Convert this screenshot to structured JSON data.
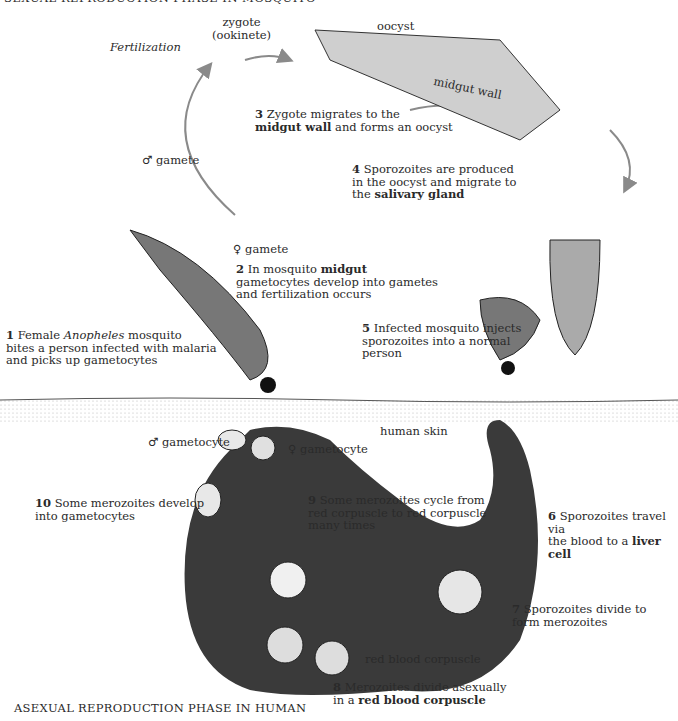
{
  "header": {
    "title_top": "SEXUAL REPRODUCTION PHASE IN MOSQUITO",
    "title_bottom": "ASEXUAL REPRODUCTION PHASE IN HUMAN"
  },
  "labels": {
    "fertilization": "Fertilization",
    "zygote": "zygote",
    "ookinete": "(ookinete)",
    "oocyst": "oocyst",
    "midgut_wall": "midgut wall",
    "male_gamete": "♂ gamete",
    "female_gamete": "♀ gamete",
    "human_skin": "human skin",
    "male_gametocyte": "♂ gametocyte",
    "female_gametocyte": "♀ gametocyte",
    "red_blood_corpuscle": "red blood corpuscle"
  },
  "steps": [
    {
      "num": "1",
      "pre": "Female ",
      "italic": "Anopheles",
      "post": " mosquito",
      "line2": "bites a person infected with malaria",
      "line3": "and picks up gametocytes"
    },
    {
      "num": "2",
      "pre": "In mosquito ",
      "bold": "midgut",
      "line2": "gametocytes develop into gametes",
      "line3": "and fertilization occurs"
    },
    {
      "num": "3",
      "line1": "Zygote migrates to the",
      "bold": "midgut wall",
      "post": " and forms an oocyst"
    },
    {
      "num": "4",
      "line1": "Sporozoites are produced",
      "line2": "in the oocyst and migrate to",
      "pre3": "the ",
      "bold": "salivary gland"
    },
    {
      "num": "5",
      "line1": "Infected mosquito injects",
      "line2": "sporozoites into a normal",
      "line3": "person"
    },
    {
      "num": "6",
      "line1": "Sporozoites travel via",
      "pre2": "the blood to a ",
      "bold": "liver cell"
    },
    {
      "num": "7",
      "line1": "Sporozoites divide to",
      "line2": "form merozoites"
    },
    {
      "num": "8",
      "line1": "Merozoites divide asexually",
      "pre2": "in a ",
      "bold": "red blood corpuscle"
    },
    {
      "num": "9",
      "line1": "Some merozoites cycle from",
      "line2": "red corpuscle to red corpuscle",
      "line3": "many times"
    },
    {
      "num": "10",
      "line1": "Some merozoites develop",
      "line2": "into gametocytes"
    }
  ],
  "colors": {
    "body_dark": "#3a3a3a",
    "arrow": "#8a8a8a",
    "cell": "#d8d8d8"
  }
}
